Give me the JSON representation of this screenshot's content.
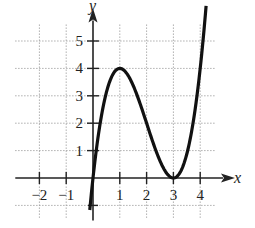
{
  "chart_data": {
    "type": "line",
    "title": "",
    "xlabel": "x",
    "ylabel": "y",
    "xlim": [
      -2.8,
      4.8
    ],
    "ylim": [
      -1.3,
      6.2
    ],
    "grid": true,
    "grid_style": "dotted",
    "x_ticks": [
      -2,
      -1,
      1,
      2,
      3,
      4
    ],
    "y_ticks": [
      1,
      2,
      3,
      4,
      5
    ],
    "x_tick_labels": [
      "−2",
      "−1",
      "1",
      "2",
      "3",
      "4"
    ],
    "y_tick_labels": [
      "1",
      "2",
      "3",
      "4",
      "5"
    ],
    "series": [
      {
        "name": "f(x)",
        "description": "cubic with local max at (1,4) and local min at (3,0)",
        "points": [
          {
            "x": -0.12,
            "y": -1.2
          },
          {
            "x": 0,
            "y": 0
          },
          {
            "x": 0.5,
            "y": 3.125
          },
          {
            "x": 1,
            "y": 4
          },
          {
            "x": 1.5,
            "y": 3.375
          },
          {
            "x": 2,
            "y": 2
          },
          {
            "x": 2.5,
            "y": 0.625
          },
          {
            "x": 3,
            "y": 0
          },
          {
            "x": 3.5,
            "y": 0.875
          },
          {
            "x": 4,
            "y": 4
          },
          {
            "x": 4.2,
            "y": 5.4
          }
        ]
      }
    ],
    "key_points": [
      {
        "label": "local max",
        "x": 1,
        "y": 4
      },
      {
        "label": "local min",
        "x": 3,
        "y": 0
      }
    ]
  },
  "labels": {
    "x_axis": "x",
    "y_axis": "y"
  }
}
